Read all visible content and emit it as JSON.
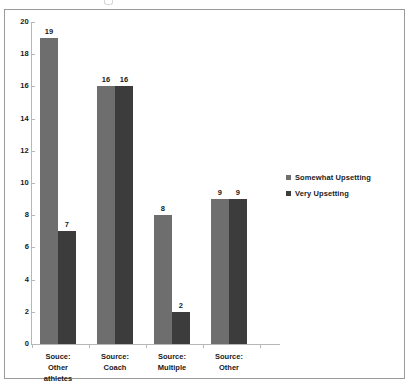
{
  "chart_data": {
    "type": "bar",
    "title": "",
    "xlabel": "",
    "ylabel": "",
    "categories": [
      "Souce:\nOther\nathletes",
      "Source:\nCoach",
      "Source:\nMultiple",
      "Source:\nOther"
    ],
    "category_lines": [
      [
        "Souce:",
        "Other",
        "athletes"
      ],
      [
        "Source:",
        "Coach"
      ],
      [
        "Source:",
        "Multiple"
      ],
      [
        "Source:",
        "Other"
      ]
    ],
    "series": [
      {
        "name": "Somewhat Upsetting",
        "color": "#6e6e6e",
        "values": [
          19,
          16,
          8,
          9
        ]
      },
      {
        "name": "Very Upsetting",
        "color": "#3c3c3c",
        "values": [
          7,
          16,
          2,
          9
        ]
      }
    ],
    "ylim": [
      0,
      20
    ],
    "ytick_step": 2,
    "yticks": [
      20,
      18,
      16,
      14,
      12,
      10,
      8,
      6,
      4,
      2,
      0
    ],
    "grid": false,
    "legend_position": "right",
    "data_labels_shown": true
  },
  "legend": {
    "entries": [
      {
        "label": "Somewhat Upsetting",
        "color": "#6e6e6e"
      },
      {
        "label": "Very Upsetting",
        "color": "#3c3c3c"
      }
    ]
  }
}
